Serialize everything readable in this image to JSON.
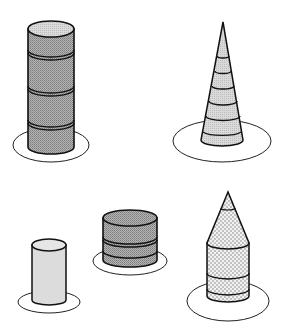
{
  "colors": {
    "outline": "#1a1a1a",
    "dark_fill": "#9a9a9a",
    "light_fill": "#d4d4d4",
    "lightest_fill": "#e2e2e2",
    "dot_fill": "#ececec",
    "plate": "#ffffff"
  },
  "shapes": [
    {
      "id": "tall-banded-cylinder",
      "description": "tall dark-shaded cylinder with three bands",
      "bands": 3,
      "position": "top-left"
    },
    {
      "id": "banded-cone",
      "description": "tall light-shaded cone with six rings",
      "bands": 6,
      "position": "top-right"
    },
    {
      "id": "plain-short-cylinder",
      "description": "short plain light-shaded cylinder",
      "bands": 0,
      "position": "bottom-left"
    },
    {
      "id": "banded-drum",
      "description": "short wide dark-shaded cylinder with two bands",
      "bands": 2,
      "position": "bottom-middle"
    },
    {
      "id": "dotted-pencil",
      "description": "dotted cylinder topped with a cone (pencil shape)",
      "bands": 2,
      "position": "bottom-right"
    }
  ]
}
